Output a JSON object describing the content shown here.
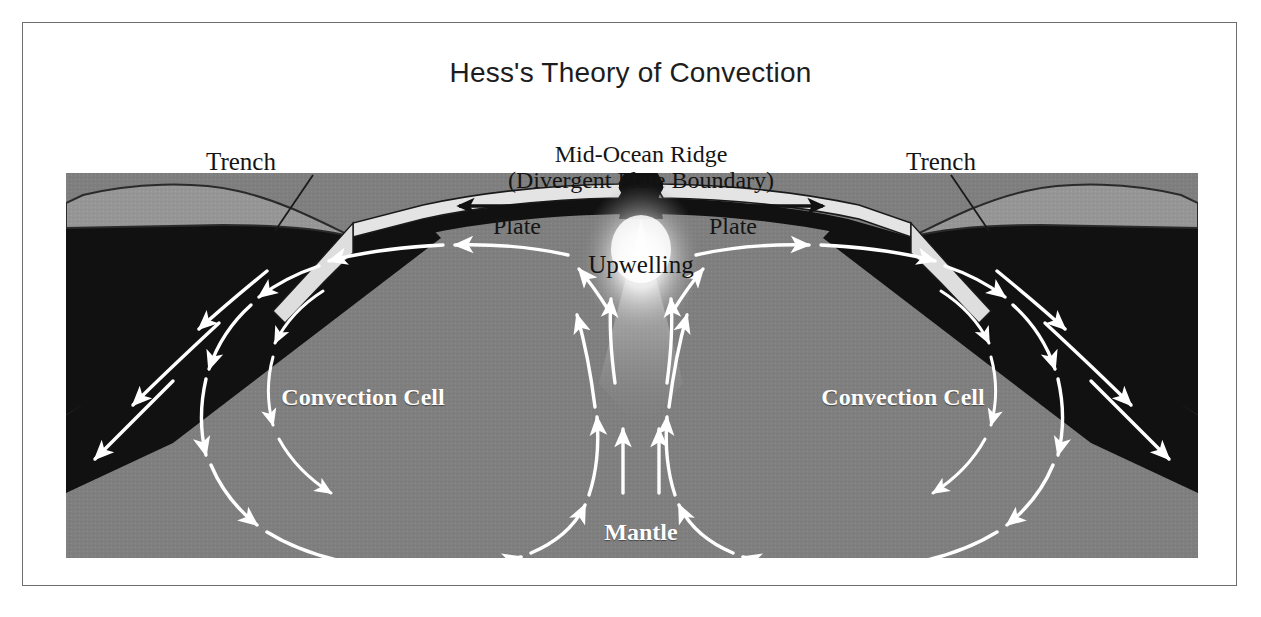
{
  "figure": {
    "title": "Hess's Theory of Convection",
    "border_color": "#6e6e6e",
    "background": "#ffffff"
  },
  "labels": {
    "trench_left": "Trench",
    "trench_right": "Trench",
    "ridge_line1": "Mid-Ocean Ridge",
    "ridge_line2": "(Divergent Plate Boundary)",
    "upwelling": "Upwelling",
    "plate_left": "Plate",
    "plate_right": "Plate",
    "convection_cell_left": "Convection Cell",
    "convection_cell_right": "Convection Cell",
    "mantle": "Mantle"
  },
  "colors": {
    "mantle_gray": "#7f7f7f",
    "continental_crust": "#949494",
    "lithosphere_black": "#111111",
    "oceanic_plate": "#e2e2e2",
    "arrow_white": "#ffffff",
    "plume_bright": "#ffffff",
    "text_dark": "#141414",
    "text_light": "#ffffff"
  },
  "diagram": {
    "type": "cross-section",
    "layers": [
      "continental crust",
      "lithosphere",
      "oceanic plate",
      "mantle"
    ],
    "features": [
      "mid-ocean ridge",
      "upwelling plume",
      "left convection cell",
      "right convection cell",
      "left trench / subduction zone",
      "right trench / subduction zone"
    ],
    "flow": {
      "left_cell_direction": "counter-clockwise",
      "right_cell_direction": "clockwise",
      "plate_left_motion": "leftward",
      "plate_right_motion": "rightward"
    }
  }
}
